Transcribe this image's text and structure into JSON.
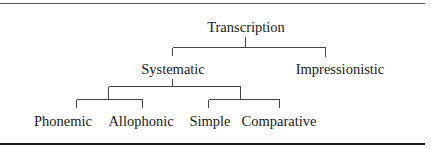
{
  "diagram": {
    "type": "tree",
    "root": {
      "label": "Transcription",
      "children": [
        {
          "label": "Systematic",
          "children": [
            {
              "label": "",
              "children": [
                {
                  "label": "Phonemic"
                },
                {
                  "label": "Allophonic"
                }
              ]
            },
            {
              "label": "",
              "children": [
                {
                  "label": "Simple"
                },
                {
                  "label": "Comparative"
                }
              ]
            }
          ]
        },
        {
          "label": "Impressionistic"
        }
      ]
    }
  },
  "labels": {
    "root": "Transcription",
    "systematic": "Systematic",
    "impressionistic": "Impressionistic",
    "phonemic": "Phonemic",
    "allophonic": "Allophonic",
    "simple": "Simple",
    "comparative": "Comparative"
  }
}
